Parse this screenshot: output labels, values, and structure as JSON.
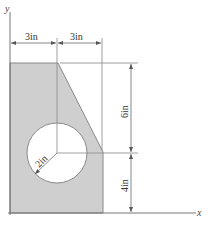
{
  "diagram": {
    "axes": {
      "x_label": "x",
      "y_label": "y"
    },
    "dimensions": {
      "top_left": "3in",
      "top_right": "3in",
      "right_upper": "6in",
      "right_lower": "4in",
      "radius": "2in"
    },
    "colors": {
      "fill": "#cfcfcf",
      "stroke": "#888888",
      "dim_line": "#555555"
    }
  }
}
